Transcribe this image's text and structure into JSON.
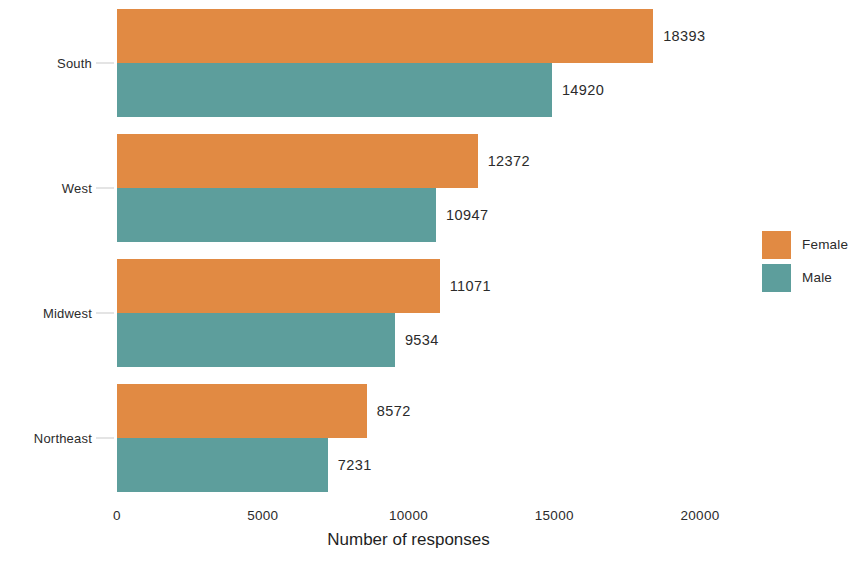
{
  "chart_data": {
    "type": "bar",
    "orientation": "horizontal",
    "grouped": true,
    "title": "",
    "xlabel": "Number of responses",
    "ylabel": "",
    "categories": [
      "South",
      "West",
      "Midwest",
      "Northeast"
    ],
    "series": [
      {
        "name": "Female",
        "color": "#e18a43",
        "values": [
          18393,
          12372,
          11071,
          8572
        ]
      },
      {
        "name": "Male",
        "color": "#5d9e9c",
        "values": [
          14920,
          10947,
          9534,
          7231
        ]
      }
    ],
    "xlim": [
      0,
      20000
    ],
    "xticks": [
      0,
      5000,
      10000,
      15000,
      20000
    ],
    "xtick_labels": [
      "0",
      "5000",
      "10000",
      "15000",
      "20000"
    ],
    "grid": false,
    "data_labels": true,
    "legend_position": "right"
  },
  "axis": {
    "x_title": "Number of responses",
    "tick_labels": [
      "0",
      "5000",
      "10000",
      "15000",
      "20000"
    ],
    "tick_values": [
      0,
      5000,
      10000,
      15000,
      20000
    ]
  },
  "categories": [
    {
      "label": "South",
      "bars": [
        {
          "series": "Female",
          "value": 18393,
          "value_label": "18393"
        },
        {
          "series": "Male",
          "value": 14920,
          "value_label": "14920"
        }
      ]
    },
    {
      "label": "West",
      "bars": [
        {
          "series": "Female",
          "value": 12372,
          "value_label": "12372"
        },
        {
          "series": "Male",
          "value": 10947,
          "value_label": "10947"
        }
      ]
    },
    {
      "label": "Midwest",
      "bars": [
        {
          "series": "Female",
          "value": 11071,
          "value_label": "11071"
        },
        {
          "series": "Male",
          "value": 9534,
          "value_label": "9534"
        }
      ]
    },
    {
      "label": "Northeast",
      "bars": [
        {
          "series": "Female",
          "value": 8572,
          "value_label": "8572"
        },
        {
          "series": "Male",
          "value": 7231,
          "value_label": "7231"
        }
      ]
    }
  ],
  "legend": {
    "entries": [
      {
        "label": "Female",
        "color": "#e18a43"
      },
      {
        "label": "Male",
        "color": "#5d9e9c"
      }
    ]
  },
  "colors": {
    "female": "#e18a43",
    "male": "#5d9e9c",
    "text": "#2b2b2b",
    "background": "#ffffff",
    "tick": "#c9c9c9"
  }
}
